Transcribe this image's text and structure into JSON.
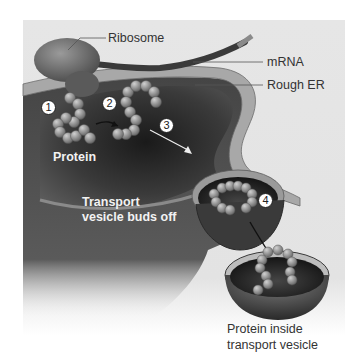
{
  "figure": {
    "colors": {
      "panel_background": "#e4e4e4",
      "er_membrane": "#9a9a9a",
      "er_lumen": "#2a2a2a",
      "ribosome": "#6f6f6f",
      "protein_beads": "#8c8c8c",
      "label_text": "#333333",
      "inner_label_text": "#f2f2f2"
    },
    "callouts": {
      "ribosome": "Ribosome",
      "mrna": "mRNA",
      "rough_er": "Rough ER"
    },
    "inner_labels": {
      "protein": "Protein",
      "vesicle_buds_line1": "Transport",
      "vesicle_buds_line2": "vesicle buds off"
    },
    "steps": [
      "1",
      "2",
      "3",
      "4"
    ],
    "caption": {
      "line1": "Protein inside",
      "line2": "transport vesicle"
    }
  }
}
